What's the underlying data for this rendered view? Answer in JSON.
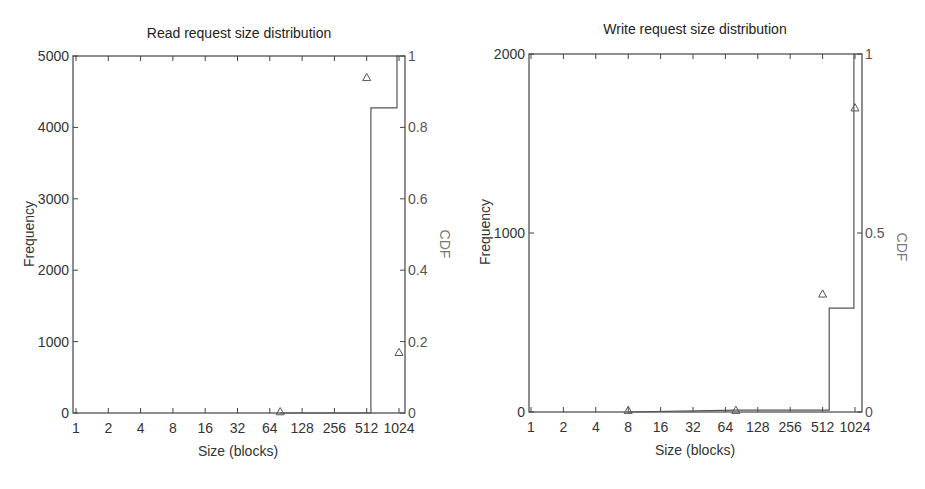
{
  "chart_data": [
    {
      "type": "scatter",
      "title": "Read request size distribution",
      "xlabel": "Size (blocks)",
      "ylabel": "Frequency",
      "y2label": "CDF",
      "x_scale": "log2",
      "x_ticks": [
        1,
        2,
        4,
        8,
        16,
        32,
        64,
        128,
        256,
        512,
        1024
      ],
      "x_tick_labels": [
        "1",
        "2",
        "4",
        "8",
        "16",
        "32",
        "64",
        "128",
        "256",
        "512",
        "1024"
      ],
      "xlim": [
        1,
        1024
      ],
      "ylim": [
        0,
        5000
      ],
      "y_ticks": [
        0,
        1000,
        2000,
        3000,
        4000,
        5000
      ],
      "y_tick_labels": [
        "0",
        "1000",
        "2000",
        "3000",
        "4000",
        "5000"
      ],
      "y2lim": [
        0,
        1
      ],
      "y2_ticks": [
        0,
        0.2,
        0.4,
        0.6,
        0.8,
        1
      ],
      "y2_tick_labels": [
        "0",
        "0.2",
        "0.4",
        "0.6",
        "0.8",
        "1"
      ],
      "grid": false,
      "series": [
        {
          "name": "Frequency",
          "marker": "triangle",
          "points": [
            [
              80,
              20
            ],
            [
              512,
              4700
            ],
            [
              1024,
              850
            ]
          ]
        },
        {
          "name": "CDF",
          "style": "step",
          "axis": "right",
          "points": [
            [
              80,
              0
            ],
            [
              560,
              0
            ],
            [
              560,
              0.855
            ],
            [
              980,
              0.855
            ],
            [
              980,
              1.0
            ],
            [
              1024,
              1.0
            ]
          ]
        }
      ]
    },
    {
      "type": "scatter",
      "title": "Write request size distribution",
      "xlabel": "Size (blocks)",
      "ylabel": "Frequency",
      "y2label": "CDF",
      "x_scale": "log2",
      "x_ticks": [
        1,
        2,
        4,
        8,
        16,
        32,
        64,
        128,
        256,
        512,
        1024
      ],
      "x_tick_labels": [
        "1",
        "2",
        "4",
        "8",
        "16",
        "32",
        "64",
        "128",
        "256",
        "512",
        "1024"
      ],
      "xlim": [
        1,
        1024
      ],
      "ylim": [
        0,
        2000
      ],
      "y_ticks": [
        0,
        1000,
        2000
      ],
      "y_tick_labels": [
        "0",
        "1000",
        "2000"
      ],
      "y2lim": [
        0,
        1
      ],
      "y2_ticks": [
        0,
        0.5,
        1
      ],
      "y2_tick_labels": [
        "0",
        "0.5",
        "1"
      ],
      "grid": false,
      "series": [
        {
          "name": "Frequency",
          "marker": "triangle",
          "points": [
            [
              8,
              10
            ],
            [
              80,
              10
            ],
            [
              512,
              660
            ],
            [
              1024,
              1700
            ]
          ]
        },
        {
          "name": "CDF",
          "style": "step",
          "axis": "right",
          "points": [
            [
              8,
              0
            ],
            [
              80,
              0.005
            ],
            [
              590,
              0.005
            ],
            [
              590,
              0.29
            ],
            [
              1000,
              0.29
            ],
            [
              1000,
              1.0
            ],
            [
              1024,
              1.0
            ]
          ]
        }
      ]
    }
  ]
}
